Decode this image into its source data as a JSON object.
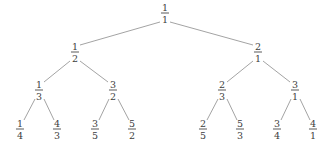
{
  "figure": {
    "name": "calkin-wilf-tree",
    "width": 333,
    "height": 146,
    "background_color": "#ffffff",
    "edge_color": "#8c8c8c",
    "text_color": "#3d3d3d",
    "fraction_bar_color": "#5a5a5a",
    "edge_width": 0.8
  },
  "nodes": [
    {
      "id": "n0",
      "numerator": "1",
      "denominator": "1",
      "label": "1/1",
      "x": 165,
      "y": 13,
      "level": 0
    },
    {
      "id": "n0L",
      "numerator": "1",
      "denominator": "2",
      "label": "1/2",
      "x": 75,
      "y": 52,
      "level": 1
    },
    {
      "id": "n0R",
      "numerator": "2",
      "denominator": "1",
      "label": "2/1",
      "x": 258,
      "y": 52,
      "level": 1
    },
    {
      "id": "n0LL",
      "numerator": "1",
      "denominator": "3",
      "label": "1/3",
      "x": 39,
      "y": 90,
      "level": 2
    },
    {
      "id": "n0LR",
      "numerator": "3",
      "denominator": "2",
      "label": "3/2",
      "x": 113,
      "y": 90,
      "level": 2
    },
    {
      "id": "n0RL",
      "numerator": "2",
      "denominator": "3",
      "label": "2/3",
      "x": 222,
      "y": 90,
      "level": 2
    },
    {
      "id": "n0RR",
      "numerator": "3",
      "denominator": "1",
      "label": "3/1",
      "x": 295,
      "y": 90,
      "level": 2
    },
    {
      "id": "n0LLL",
      "numerator": "1",
      "denominator": "4",
      "label": "1/4",
      "x": 20,
      "y": 129,
      "level": 3
    },
    {
      "id": "n0LLR",
      "numerator": "4",
      "denominator": "3",
      "label": "4/3",
      "x": 57,
      "y": 129,
      "level": 3
    },
    {
      "id": "n0LRL",
      "numerator": "3",
      "denominator": "5",
      "label": "3/5",
      "x": 95,
      "y": 129,
      "level": 3
    },
    {
      "id": "n0LRR",
      "numerator": "5",
      "denominator": "2",
      "label": "5/2",
      "x": 132,
      "y": 129,
      "level": 3
    },
    {
      "id": "n0RLL",
      "numerator": "2",
      "denominator": "5",
      "label": "2/5",
      "x": 203,
      "y": 129,
      "level": 3
    },
    {
      "id": "n0RLR",
      "numerator": "5",
      "denominator": "3",
      "label": "5/3",
      "x": 240,
      "y": 129,
      "level": 3
    },
    {
      "id": "n0RRL",
      "numerator": "3",
      "denominator": "4",
      "label": "3/4",
      "x": 277,
      "y": 129,
      "level": 3
    },
    {
      "id": "n0RRR",
      "numerator": "4",
      "denominator": "1",
      "label": "4/1",
      "x": 313,
      "y": 129,
      "level": 3
    }
  ],
  "edges": [
    {
      "from": "n0",
      "to": "n0L",
      "x1": 160,
      "y1": 22,
      "x2": 80,
      "y2": 45
    },
    {
      "from": "n0",
      "to": "n0R",
      "x1": 170,
      "y1": 22,
      "x2": 253,
      "y2": 45
    },
    {
      "from": "n0L",
      "to": "n0LL",
      "x1": 70,
      "y1": 61,
      "x2": 44,
      "y2": 82
    },
    {
      "from": "n0L",
      "to": "n0LR",
      "x1": 80,
      "y1": 61,
      "x2": 108,
      "y2": 82
    },
    {
      "from": "n0R",
      "to": "n0RL",
      "x1": 253,
      "y1": 61,
      "x2": 227,
      "y2": 82
    },
    {
      "from": "n0R",
      "to": "n0RR",
      "x1": 263,
      "y1": 61,
      "x2": 290,
      "y2": 82
    },
    {
      "from": "n0LL",
      "to": "n0LLL",
      "x1": 35,
      "y1": 99,
      "x2": 24,
      "y2": 120
    },
    {
      "from": "n0LL",
      "to": "n0LLR",
      "x1": 44,
      "y1": 99,
      "x2": 54,
      "y2": 120
    },
    {
      "from": "n0LR",
      "to": "n0LRL",
      "x1": 109,
      "y1": 99,
      "x2": 99,
      "y2": 120
    },
    {
      "from": "n0LR",
      "to": "n0LRR",
      "x1": 118,
      "y1": 99,
      "x2": 129,
      "y2": 120
    },
    {
      "from": "n0RL",
      "to": "n0RLL",
      "x1": 218,
      "y1": 99,
      "x2": 207,
      "y2": 120
    },
    {
      "from": "n0RL",
      "to": "n0RLR",
      "x1": 227,
      "y1": 99,
      "x2": 237,
      "y2": 120
    },
    {
      "from": "n0RR",
      "to": "n0RRL",
      "x1": 291,
      "y1": 99,
      "x2": 281,
      "y2": 120
    },
    {
      "from": "n0RR",
      "to": "n0RRR",
      "x1": 300,
      "y1": 99,
      "x2": 310,
      "y2": 120
    }
  ]
}
